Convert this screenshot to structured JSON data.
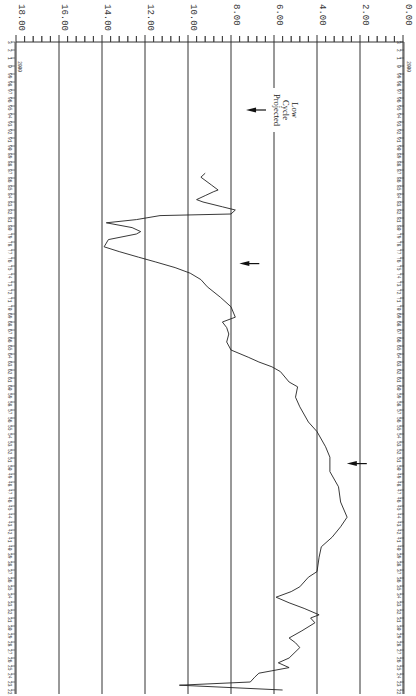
{
  "chart_data": {
    "type": "line",
    "orientation": "rotated-90-clockwise",
    "title": "",
    "xlabel": "Year",
    "ylabel": "",
    "ylim": [
      0,
      18
    ],
    "y_ticks": [
      "0.00",
      "2.00",
      "4.00",
      "6.00",
      "8.00",
      "10.00",
      "12.00",
      "14.00",
      "16.00",
      "18.00"
    ],
    "x_range": [
      1922,
      2003
    ],
    "x_tick_labels": [
      "22",
      "23",
      "24",
      "25",
      "26",
      "27",
      "28",
      "29",
      "30",
      "31",
      "32",
      "33",
      "34",
      "35",
      "36",
      "37",
      "38",
      "39",
      "40",
      "41",
      "42",
      "43",
      "44",
      "45",
      "46",
      "47",
      "48",
      "49",
      "50",
      "51",
      "52",
      "53",
      "54",
      "55",
      "56",
      "57",
      "58",
      "59",
      "60",
      "61",
      "62",
      "63",
      "64",
      "65",
      "66",
      "67",
      "68",
      "69",
      "70",
      "71",
      "72",
      "73",
      "74",
      "75",
      "76",
      "77",
      "78",
      "79",
      "80",
      "81",
      "82",
      "83",
      "84",
      "85",
      "86",
      "87",
      "88",
      "89",
      "90",
      "91",
      "92",
      "93",
      "94",
      "95",
      "96",
      "97",
      "98",
      "99",
      "0",
      "1",
      "2",
      "3"
    ],
    "x_sublabel": "2000",
    "grid": true,
    "legend": null,
    "series": [
      {
        "name": "value",
        "x": [
          1922.0,
          1922.6,
          1923.0,
          1923.6,
          1924.1,
          1924.4,
          1924.8,
          1925.4,
          1926.0,
          1927.3,
          1927.9,
          1928.5,
          1929.4,
          1930.4,
          1931.0,
          1931.4,
          1932.2,
          1932.9,
          1933.6,
          1934.3,
          1934.9,
          1936.1,
          1936.8,
          1938.6,
          1939.9,
          1941.1,
          1942.4,
          1943.6,
          1945.5,
          1947.4,
          1949.3,
          1951.1,
          1952.4,
          1954.3,
          1955.5,
          1957.4,
          1958.6,
          1959.9,
          1960.5,
          1961.8,
          1962.4,
          1963.0,
          1963.6,
          1964.5,
          1965.5,
          1966.5,
          1967.3,
          1968.0,
          1968.6,
          1969.9,
          1971.1,
          1972.4,
          1973.3,
          1974.1,
          1974.8,
          1975.5,
          1976.1,
          1976.8,
          1977.4,
          1978.3,
          1979.0,
          1979.3,
          1979.8,
          1980.4,
          1980.8,
          1981.3,
          1981.5,
          1982.0,
          1982.4,
          1983.0,
          1983.3,
          1983.8,
          1984.3,
          1984.5,
          1985.1,
          1986.1,
          1986.6
        ],
        "values": [
          5.6,
          10.4,
          7.1,
          6.9,
          6.7,
          6.1,
          5.3,
          5.8,
          5.3,
          4.8,
          5.0,
          5.3,
          4.7,
          4.1,
          4.3,
          3.9,
          4.6,
          5.3,
          5.9,
          5.2,
          4.8,
          4.4,
          4.0,
          3.9,
          3.8,
          3.3,
          2.9,
          2.6,
          2.9,
          3.0,
          3.4,
          3.4,
          3.6,
          4.0,
          4.4,
          4.8,
          5.0,
          4.9,
          5.3,
          5.7,
          6.1,
          6.7,
          7.2,
          8.0,
          8.2,
          8.1,
          8.2,
          8.4,
          7.8,
          8.0,
          8.5,
          9.1,
          9.4,
          9.9,
          10.6,
          11.5,
          12.3,
          13.2,
          13.9,
          13.7,
          12.4,
          12.2,
          12.6,
          13.8,
          12.4,
          11.3,
          8.0,
          7.8,
          8.4,
          9.3,
          9.6,
          9.2,
          8.8,
          8.6,
          8.9,
          9.4,
          9.2
        ]
      }
    ],
    "annotations": [
      {
        "text": [
          "Projected",
          "Cycle",
          "Low"
        ],
        "x_year": 1994.5,
        "note": "vertical line at 6.00 with arrow pointing at ~7.3"
      },
      {
        "type": "arrow",
        "x_year": 1975.3,
        "pointing_at_value": 7.8
      },
      {
        "type": "arrow",
        "x_year": 1950.3,
        "pointing_at_value": 2.8
      }
    ]
  }
}
